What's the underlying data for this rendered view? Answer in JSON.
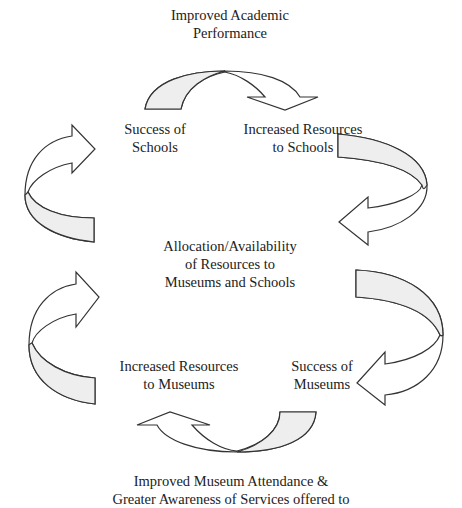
{
  "diagram": {
    "top_outcome": {
      "line1": "Improved Academic",
      "line2": "Performance"
    },
    "success_schools": {
      "line1": "Success of",
      "line2": "Schools"
    },
    "resources_schools": {
      "line1": "Increased Resources",
      "line2": "to Schools"
    },
    "center": {
      "line1": "Allocation/Availability",
      "line2": "of Resources to",
      "line3": "Museums and Schools"
    },
    "resources_museums": {
      "line1": "Increased Resources",
      "line2": "to Museums"
    },
    "success_museums": {
      "line1": "Success of",
      "line2": "Museums"
    },
    "bottom_outcome": {
      "line1": "Improved Museum Attendance &",
      "line2": "Greater Awareness of  Services offered to"
    },
    "arrows": [
      {
        "name": "top-arrow",
        "direction": "clockwise",
        "from": "Success of Schools",
        "to": "Increased Resources to Schools"
      },
      {
        "name": "upper-right-arrow",
        "direction": "clockwise",
        "from": "Increased Resources to Schools",
        "to": "Allocation/Availability of Resources to Museums and Schools"
      },
      {
        "name": "upper-left-arrow",
        "direction": "clockwise",
        "from": "Allocation/Availability of Resources to Museums and Schools",
        "to": "Success of Schools"
      },
      {
        "name": "lower-right-arrow",
        "direction": "clockwise",
        "from": "Allocation/Availability of Resources to Museums and Schools",
        "to": "Success of Museums"
      },
      {
        "name": "bottom-arrow",
        "direction": "clockwise",
        "from": "Success of Museums",
        "to": "Increased Resources to Museums"
      },
      {
        "name": "lower-left-arrow",
        "direction": "clockwise",
        "from": "Increased Resources to Museums",
        "to": "Allocation/Availability of Resources to Museums and Schools"
      }
    ],
    "colors": {
      "arrow_fill": "#ffffff",
      "arrow_band": "#eeeeee",
      "stroke": "#333333",
      "text": "#222222"
    }
  }
}
